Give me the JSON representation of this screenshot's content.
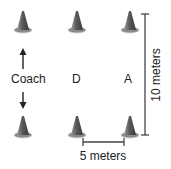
{
  "diagram": {
    "labels": {
      "coach": "Coach",
      "defender": "D",
      "attacker": "A"
    },
    "dimensions": {
      "height_label": "10 meters",
      "width_label": "5 meters"
    },
    "cones": [
      {
        "row": "top",
        "col": 1
      },
      {
        "row": "top",
        "col": 2
      },
      {
        "row": "top",
        "col": 3
      },
      {
        "row": "bottom",
        "col": 1
      },
      {
        "row": "bottom",
        "col": 2
      },
      {
        "row": "bottom",
        "col": 3
      }
    ],
    "colors": {
      "cone": "#6e6e6e",
      "ink": "#222222"
    }
  }
}
